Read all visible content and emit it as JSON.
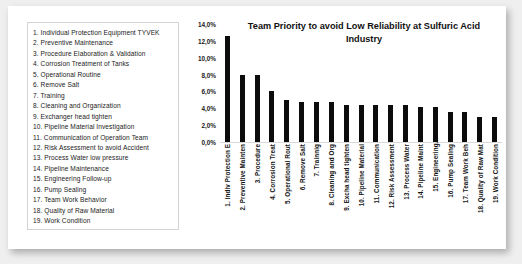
{
  "legend": {
    "items": [
      "1. Individual Protection Equipment TYVEK",
      "2. Preventive Maintenance",
      "3. Procedure Elaboration & Validation",
      "4. Corrosion Treatment of Tanks",
      "5. Operational Routine",
      "6. Remove Salt",
      "7. Training",
      "8. Cleaning and Organization",
      "9. Exchanger head tighten",
      "10. Pipeline Material Investigation",
      "11. Communication of Operation Team",
      "12. Risk Assessment to avoid Accident",
      "13. Process Water low pressure",
      "14. Pipeline Maintenance",
      "15. Engineering Follow-up",
      "16. Pump Sealing",
      "17. Team Work Behavior",
      "18. Quality of Raw Material",
      "19. Work Condition"
    ]
  },
  "chart_data": {
    "type": "bar",
    "title": "Team Priority to avoid Low Reliability at Sulfuric Acid Industry",
    "xlabel": "",
    "ylabel": "",
    "ylim": [
      0,
      14
    ],
    "ytick_labels": [
      "14,0%",
      "12,0%",
      "10,0%",
      "8,0%",
      "6,0%",
      "4,0%",
      "2,0%",
      "0,0%"
    ],
    "ytick_values": [
      14,
      12,
      10,
      8,
      6,
      4,
      2,
      0
    ],
    "grid": false,
    "legend_position": "none",
    "bar_color": "#0c0c0c",
    "categories": [
      "1. Indiv Protection E",
      "2. Preventive Mainten",
      "3. Procedure",
      "4. Corrosion Treat",
      "5. Operational Rout",
      "6. Remove Salt",
      "7. Trainnig",
      "8. Cleaning and Org",
      "9. Excha head tighten",
      "10. Pipeline Material",
      "11. Communication",
      "12. Risk Assessment",
      "13. Process Water",
      "14. Pipeline Maint",
      "15. Engineering…",
      "16. Pump Sealing",
      "17. Team Work Beh",
      "18. Quality of Raw Mat",
      "19. Work Condition"
    ],
    "values": [
      12.6,
      8.0,
      8.0,
      6.1,
      5.0,
      4.8,
      4.8,
      4.8,
      4.4,
      4.4,
      4.4,
      4.4,
      4.4,
      4.2,
      4.2,
      3.6,
      3.6,
      3.0,
      3.0
    ]
  }
}
